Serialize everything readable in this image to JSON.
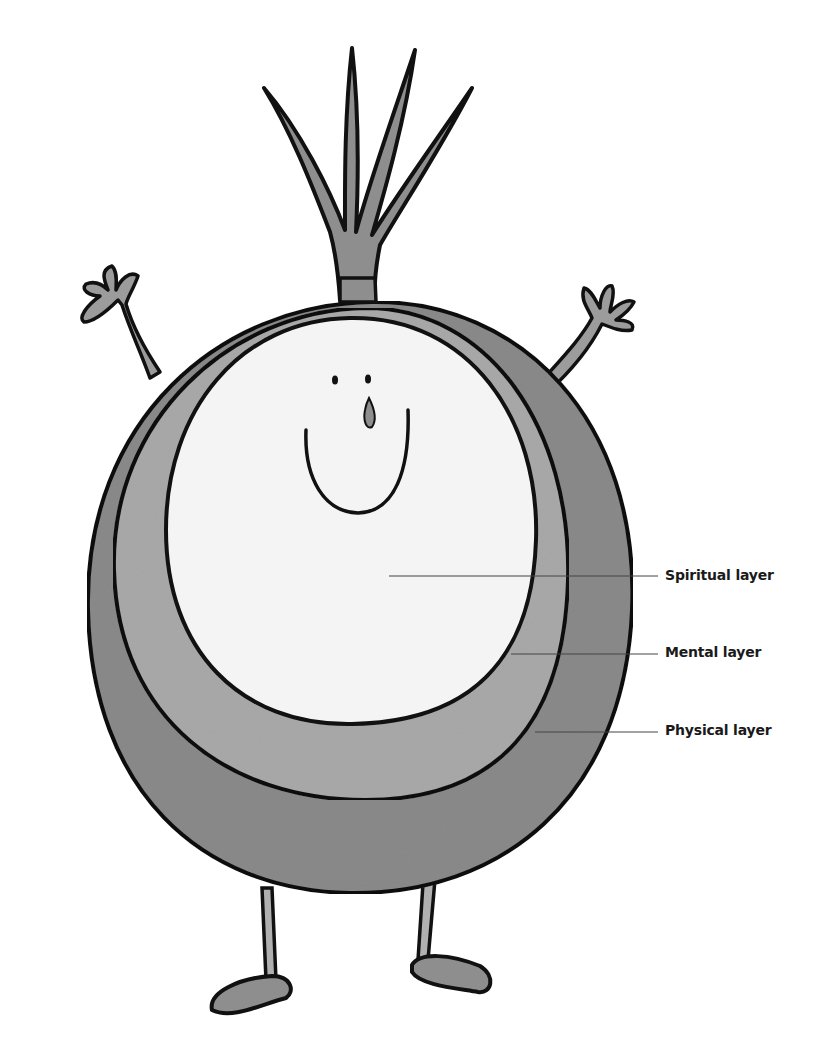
{
  "diagram": {
    "colors": {
      "outline": "#111111",
      "physical_layer": "#8a8a8a",
      "mental_layer": "#a8a8a8",
      "spiritual_layer": "#f4f4f4",
      "limbs": "#9c9c9c",
      "leader_line": "#444444",
      "label_text": "#1a1a1a"
    },
    "labels": [
      {
        "id": "spiritual",
        "text": "Spiritual layer",
        "x": 665,
        "y": 577
      },
      {
        "id": "mental",
        "text": "Mental layer",
        "x": 665,
        "y": 653
      },
      {
        "id": "physical",
        "text": "Physical layer",
        "x": 665,
        "y": 731
      }
    ]
  }
}
